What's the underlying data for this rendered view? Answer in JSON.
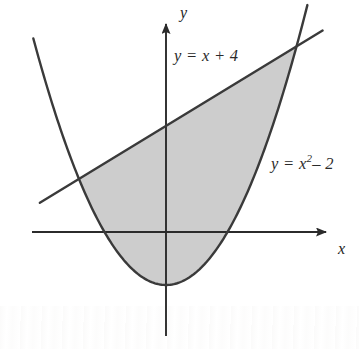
{
  "figure": {
    "type": "math-graph",
    "background_color": "#ffffff",
    "stroke_color": "#3a3a3a",
    "shade_color": "#cdcdcd"
  },
  "axes": {
    "x_label": "x",
    "y_label": "y",
    "origin_px": [
      166,
      232
    ],
    "x_scale_px_per_unit": 43.5,
    "y_scale_px_per_unit": 26.5,
    "x_axis_start_px": [
      32,
      232
    ],
    "x_axis_end_px": [
      330,
      232
    ],
    "y_axis_top_px": [
      166,
      18
    ],
    "y_axis_bottom_px": [
      166,
      336
    ],
    "arrowheads": [
      "x-positive",
      "y-positive"
    ],
    "ticks_shown": false,
    "gridlines": false
  },
  "labels": {
    "line_label": "y = x + 4",
    "parabola_label_prefix": "y = x",
    "parabola_label_exponent": "2",
    "parabola_label_suffix": "– 2"
  },
  "chart_data": {
    "type": "line",
    "title": "",
    "xlabel": "x",
    "ylabel": "y",
    "xlim": [
      -3.1,
      3.8
    ],
    "ylim": [
      -2.6,
      8.1
    ],
    "grid": false,
    "legend": "inline-annotations",
    "series": [
      {
        "name": "y = x + 4",
        "equation": "y = x + 4",
        "kind": "line",
        "slope": 1,
        "intercept": 4,
        "domain": [
          -2.9,
          3.6
        ]
      },
      {
        "name": "y = x^2 - 2",
        "equation": "y = x² – 2",
        "kind": "parabola",
        "a": 1,
        "b": 0,
        "c": -2,
        "vertex": [
          0,
          -2
        ],
        "x_intercepts": [
          -1.414,
          1.414
        ],
        "domain": [
          -3.05,
          3.25
        ]
      }
    ],
    "intersections": [
      {
        "x": -2,
        "y": 2
      },
      {
        "x": 3,
        "y": 7
      }
    ],
    "shaded_region": {
      "description": "Region between y = x + 4 (above) and y = x² – 2 (below) from x = -2 to x = 3",
      "upper_curve": "y = x + 4",
      "lower_curve": "y = x² – 2",
      "x_from": -2,
      "x_to": 3,
      "fill": "#cdcdcd"
    }
  }
}
